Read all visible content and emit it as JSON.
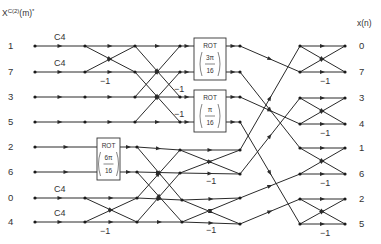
{
  "header": {
    "input_label": "X",
    "input_sup": "C(2)",
    "input_suffix": "(m)",
    "input_star": "*",
    "output_label": "x(n)"
  },
  "inputs": [
    {
      "label": "1",
      "y": 46
    },
    {
      "label": "7",
      "y": 72
    },
    {
      "label": "3",
      "y": 97
    },
    {
      "label": "5",
      "y": 122
    },
    {
      "label": "2",
      "y": 147
    },
    {
      "label": "6",
      "y": 172
    },
    {
      "label": "0",
      "y": 198
    },
    {
      "label": "4",
      "y": 222
    }
  ],
  "outputs": [
    {
      "label": "0",
      "y": 46
    },
    {
      "label": "7",
      "y": 72
    },
    {
      "label": "3",
      "y": 98
    },
    {
      "label": "4",
      "y": 124
    },
    {
      "label": "1",
      "y": 148
    },
    {
      "label": "6",
      "y": 174
    },
    {
      "label": "2",
      "y": 199
    },
    {
      "label": "5",
      "y": 224
    }
  ],
  "multiplier_labels": [
    {
      "text": "C4",
      "x": 54,
      "y": 40
    },
    {
      "text": "C4",
      "x": 54,
      "y": 66
    },
    {
      "text": "C4",
      "x": 54,
      "y": 192
    },
    {
      "text": "C4",
      "x": 54,
      "y": 216
    },
    {
      "text": "−1",
      "x": 100,
      "y": 84
    },
    {
      "text": "−1",
      "x": 100,
      "y": 234
    },
    {
      "text": "−1",
      "x": 174,
      "y": 92
    },
    {
      "text": "−1",
      "x": 174,
      "y": 117
    },
    {
      "text": "−1",
      "x": 206,
      "y": 184
    },
    {
      "text": "−1",
      "x": 206,
      "y": 233
    },
    {
      "text": "−1",
      "x": 320,
      "y": 84
    },
    {
      "text": "−1",
      "x": 320,
      "y": 136
    },
    {
      "text": "−1",
      "x": 320,
      "y": 186
    },
    {
      "text": "−1",
      "x": 320,
      "y": 236
    }
  ],
  "rot_blocks": [
    {
      "label": "ROT",
      "num": "3π",
      "den": "16",
      "x": 194,
      "y": 38,
      "w": 32,
      "h": 42
    },
    {
      "label": "ROT",
      "num": "π",
      "den": "16",
      "x": 194,
      "y": 90,
      "w": 32,
      "h": 42
    },
    {
      "label": "ROT",
      "num": "6π",
      "den": "16",
      "x": 97,
      "y": 138,
      "w": 23,
      "h": 42
    }
  ],
  "nodes": [
    [
      35,
      46
    ],
    [
      35,
      72
    ],
    [
      35,
      97
    ],
    [
      35,
      122
    ],
    [
      35,
      147
    ],
    [
      35,
      172
    ],
    [
      35,
      198
    ],
    [
      35,
      222
    ],
    [
      85,
      46
    ],
    [
      85,
      72
    ],
    [
      85,
      97
    ],
    [
      85,
      122
    ],
    [
      85,
      198
    ],
    [
      85,
      222
    ],
    [
      135,
      46
    ],
    [
      135,
      72
    ],
    [
      135,
      97
    ],
    [
      135,
      122
    ],
    [
      180,
      46
    ],
    [
      180,
      72
    ],
    [
      180,
      97
    ],
    [
      180,
      122
    ],
    [
      240,
      46
    ],
    [
      240,
      72
    ],
    [
      240,
      97
    ],
    [
      240,
      122
    ],
    [
      137,
      147
    ],
    [
      137,
      172
    ],
    [
      137,
      198
    ],
    [
      137,
      222
    ],
    [
      180,
      150
    ],
    [
      180,
      173
    ],
    [
      182,
      200
    ],
    [
      182,
      222
    ],
    [
      240,
      150
    ],
    [
      240,
      174
    ],
    [
      240,
      198
    ],
    [
      240,
      224
    ],
    [
      300,
      46
    ],
    [
      300,
      72
    ],
    [
      300,
      98
    ],
    [
      300,
      124
    ],
    [
      300,
      148
    ],
    [
      300,
      174
    ],
    [
      300,
      199
    ],
    [
      300,
      224
    ],
    [
      345,
      46
    ],
    [
      345,
      72
    ],
    [
      345,
      98
    ],
    [
      345,
      124
    ],
    [
      345,
      148
    ],
    [
      345,
      174
    ],
    [
      345,
      199
    ],
    [
      345,
      224
    ]
  ],
  "edges": [
    [
      35,
      46,
      85,
      46
    ],
    [
      35,
      72,
      85,
      72
    ],
    [
      35,
      97,
      85,
      97
    ],
    [
      35,
      122,
      85,
      122
    ],
    [
      35,
      147,
      97,
      147
    ],
    [
      35,
      172,
      97,
      172
    ],
    [
      35,
      198,
      85,
      198
    ],
    [
      35,
      222,
      85,
      222
    ],
    [
      85,
      46,
      135,
      46
    ],
    [
      85,
      72,
      135,
      72
    ],
    [
      85,
      46,
      135,
      72
    ],
    [
      85,
      72,
      135,
      46
    ],
    [
      85,
      97,
      135,
      97
    ],
    [
      85,
      122,
      135,
      122
    ],
    [
      85,
      198,
      137,
      198
    ],
    [
      85,
      222,
      137,
      222
    ],
    [
      85,
      198,
      137,
      222
    ],
    [
      85,
      222,
      137,
      198
    ],
    [
      120,
      147,
      137,
      147
    ],
    [
      120,
      172,
      137,
      172
    ],
    [
      135,
      46,
      180,
      46
    ],
    [
      135,
      72,
      180,
      72
    ],
    [
      135,
      97,
      180,
      97
    ],
    [
      135,
      122,
      180,
      122
    ],
    [
      135,
      46,
      180,
      97
    ],
    [
      135,
      72,
      180,
      122
    ],
    [
      135,
      97,
      180,
      46
    ],
    [
      135,
      122,
      180,
      72
    ],
    [
      137,
      147,
      180,
      150
    ],
    [
      137,
      172,
      180,
      173
    ],
    [
      137,
      198,
      182,
      200
    ],
    [
      137,
      222,
      182,
      222
    ],
    [
      137,
      147,
      182,
      200
    ],
    [
      137,
      172,
      182,
      222
    ],
    [
      137,
      198,
      180,
      150
    ],
    [
      137,
      222,
      180,
      173
    ],
    [
      180,
      46,
      194,
      46
    ],
    [
      180,
      72,
      194,
      72
    ],
    [
      180,
      97,
      194,
      97
    ],
    [
      180,
      122,
      194,
      122
    ],
    [
      226,
      46,
      240,
      46
    ],
    [
      226,
      72,
      240,
      72
    ],
    [
      226,
      97,
      240,
      97
    ],
    [
      226,
      122,
      240,
      122
    ],
    [
      180,
      150,
      240,
      150
    ],
    [
      180,
      173,
      240,
      174
    ],
    [
      182,
      200,
      240,
      198
    ],
    [
      182,
      222,
      240,
      224
    ],
    [
      180,
      150,
      240,
      174
    ],
    [
      180,
      173,
      240,
      150
    ],
    [
      182,
      200,
      240,
      224
    ],
    [
      182,
      222,
      240,
      198
    ],
    [
      240,
      46,
      300,
      72
    ],
    [
      240,
      72,
      300,
      148
    ],
    [
      240,
      97,
      300,
      124
    ],
    [
      240,
      122,
      300,
      224
    ],
    [
      240,
      150,
      300,
      46
    ],
    [
      240,
      174,
      300,
      98
    ],
    [
      240,
      198,
      300,
      174
    ],
    [
      240,
      224,
      300,
      199
    ],
    [
      300,
      46,
      345,
      46
    ],
    [
      300,
      72,
      345,
      72
    ],
    [
      300,
      46,
      345,
      72
    ],
    [
      300,
      72,
      345,
      46
    ],
    [
      300,
      98,
      345,
      98
    ],
    [
      300,
      124,
      345,
      124
    ],
    [
      300,
      98,
      345,
      124
    ],
    [
      300,
      124,
      345,
      98
    ],
    [
      300,
      148,
      345,
      148
    ],
    [
      300,
      174,
      345,
      174
    ],
    [
      300,
      148,
      345,
      174
    ],
    [
      300,
      174,
      345,
      148
    ],
    [
      300,
      199,
      345,
      199
    ],
    [
      300,
      224,
      345,
      224
    ],
    [
      300,
      199,
      345,
      224
    ],
    [
      300,
      224,
      345,
      199
    ]
  ]
}
